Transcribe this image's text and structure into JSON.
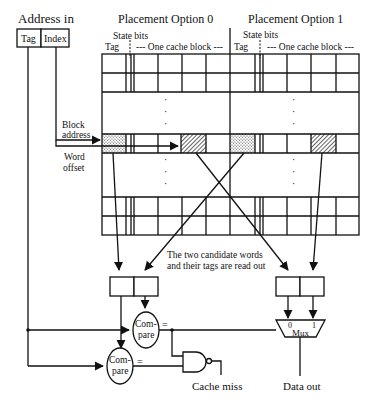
{
  "address": {
    "title": "Address in",
    "fields": [
      "Tag",
      "Index"
    ]
  },
  "options": [
    {
      "title": "Placement Option 0",
      "state_label": "State bits",
      "tag_label": "Tag",
      "block_label": "--- One cache block ---"
    },
    {
      "title": "Placement Option 1",
      "state_label": "State bits",
      "tag_label": "Tag",
      "block_label": "--- One cache block ---"
    }
  ],
  "labels": {
    "block_address_1": "Block",
    "block_address_2": "address",
    "word_offset_1": "Word",
    "word_offset_2": "offset",
    "readout_1": "The two candidate words",
    "readout_2": "and their tags are read out",
    "dots": "·",
    "compare_1_top": "Com-",
    "compare_1_bottom": "pare",
    "compare_2_top": "Com-",
    "compare_2_bottom": "pare",
    "equals_1": "=",
    "equals_2": "=",
    "mux_0": "0",
    "mux_1": "1",
    "mux_label": "Mux",
    "cache_miss": "Cache miss",
    "data_out": "Data out"
  },
  "colors": {
    "ink": "#111111",
    "background": "#ffffff"
  }
}
